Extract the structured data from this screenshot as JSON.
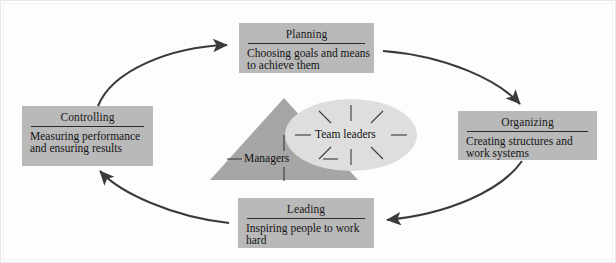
{
  "diagram": {
    "colors": {
      "background": "#fdfdfd",
      "box_fill": "#b9b9b9",
      "triangle_fill": "#a8a8a8",
      "ellipse_fill": "#dcdcdc",
      "arrow": "#3a3a3a",
      "text": "#141414"
    },
    "functions": [
      {
        "id": "planning",
        "title": "Planning",
        "description": "Choosing goals and means to achieve them"
      },
      {
        "id": "organizing",
        "title": "Organizing",
        "description": "Creating structures and work systems"
      },
      {
        "id": "leading",
        "title": "Leading",
        "description": "Inspiring people to work hard"
      },
      {
        "id": "controlling",
        "title": "Controlling",
        "description": "Measuring performance and ensuring results"
      }
    ],
    "center": {
      "triangle_label": "Managers",
      "ellipse_label": "Team leaders"
    }
  }
}
